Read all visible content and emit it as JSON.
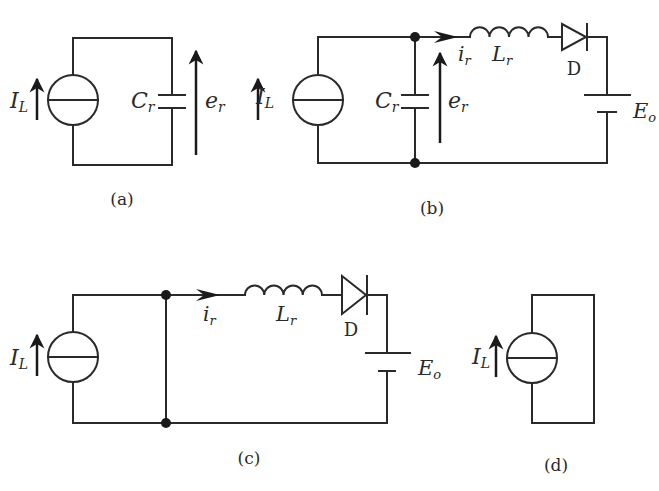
{
  "figure": {
    "panels": [
      {
        "id": "a",
        "caption": "(a)",
        "components": {
          "current_source": {
            "symbol": "I",
            "subscript": "L"
          },
          "capacitor": {
            "symbol": "C",
            "subscript": "r"
          },
          "voltage": {
            "symbol": "e",
            "subscript": "r"
          }
        }
      },
      {
        "id": "b",
        "caption": "(b)",
        "components": {
          "current_source": {
            "symbol": "I",
            "subscript": "L"
          },
          "capacitor": {
            "symbol": "C",
            "subscript": "r"
          },
          "voltage": {
            "symbol": "e",
            "subscript": "r"
          },
          "current": {
            "symbol": "i",
            "subscript": "r"
          },
          "inductor": {
            "symbol": "L",
            "subscript": "r"
          },
          "diode": {
            "symbol": "D"
          },
          "battery": {
            "symbol": "E",
            "subscript": "o"
          }
        }
      },
      {
        "id": "c",
        "caption": "(c)",
        "components": {
          "current_source": {
            "symbol": "I",
            "subscript": "L"
          },
          "current": {
            "symbol": "i",
            "subscript": "r"
          },
          "inductor": {
            "symbol": "L",
            "subscript": "r"
          },
          "diode": {
            "symbol": "D"
          },
          "battery": {
            "symbol": "E",
            "subscript": "o"
          }
        }
      },
      {
        "id": "d",
        "caption": "(d)",
        "components": {
          "current_source": {
            "symbol": "I",
            "subscript": "L"
          }
        }
      }
    ]
  }
}
